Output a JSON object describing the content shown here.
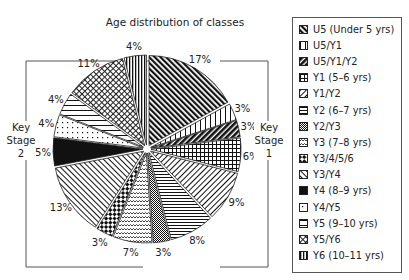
{
  "chart_data": {
    "type": "pie",
    "title": "Age distribution of classes",
    "unit": "%",
    "start_angle_deg": 0,
    "direction": "clockwise",
    "slices": [
      {
        "label": "U5 (Under 5 yrs)",
        "value": 17,
        "pattern": "diag-dark"
      },
      {
        "label": "U5/Y1",
        "value": 3,
        "pattern": "vertical-wide"
      },
      {
        "label": "U5/Y1/Y2",
        "value": 3,
        "pattern": "diag-heavy"
      },
      {
        "label": "Y1 (5–6 yrs)",
        "value": 6,
        "pattern": "grid"
      },
      {
        "label": "Y1/Y2",
        "value": 9,
        "pattern": "diag-light"
      },
      {
        "label": "Y2 (6–7 yrs)",
        "value": 8,
        "pattern": "horizontal"
      },
      {
        "label": "Y2/Y3",
        "value": 3,
        "pattern": "small-check"
      },
      {
        "label": "Y3 (7–8 yrs)",
        "value": 7,
        "pattern": "wave"
      },
      {
        "label": "Y3/4/5/6",
        "value": 3,
        "pattern": "checker"
      },
      {
        "label": "Y3/Y4",
        "value": 13,
        "pattern": "diag-back"
      },
      {
        "label": "Y4 (8–9 yrs)",
        "value": 5,
        "pattern": "solid"
      },
      {
        "label": "Y4/Y5",
        "value": 4,
        "pattern": "dots"
      },
      {
        "label": "Y5 (9–10 yrs)",
        "value": 4,
        "pattern": "horizontal-wide"
      },
      {
        "label": "Y5/Y6",
        "value": 11,
        "pattern": "crosshatch"
      },
      {
        "label": "Y6 (10–11 yrs)",
        "value": 4,
        "pattern": "vertical"
      }
    ],
    "annotations": [
      {
        "text": "Key Stage 1",
        "side": "right",
        "covers": [
          "U5 (Under 5 yrs)",
          "U5/Y1",
          "U5/Y1/Y2",
          "Y1 (5–6 yrs)",
          "Y1/Y2",
          "Y2 (6–7 yrs)"
        ]
      },
      {
        "text": "Key Stage 2",
        "side": "left",
        "covers": [
          "Y3 (7–8 yrs)",
          "Y3/4/5/6",
          "Y3/Y4",
          "Y4 (8–9 yrs)",
          "Y4/Y5",
          "Y5 (9–10 yrs)",
          "Y5/Y6",
          "Y6 (10–11 yrs)"
        ]
      }
    ],
    "legend_position": "right",
    "grid": false
  },
  "labels": {
    "title": "Age distribution of classes",
    "key_stage_1": [
      "Key",
      "Stage",
      "1"
    ],
    "key_stage_2": [
      "Key",
      "Stage",
      "2"
    ]
  }
}
